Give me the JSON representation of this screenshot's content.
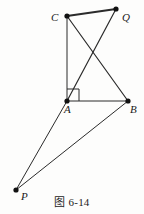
{
  "figure": {
    "caption": "图 6-14",
    "background_color": "#fdfdfc",
    "stroke_color": "#2b2b2b",
    "vertex_color": "#111111",
    "vertices": [
      {
        "id": "C",
        "label": "C",
        "x": 67,
        "y": 16,
        "label_x": 51,
        "label_y": 12
      },
      {
        "id": "Q",
        "label": "Q",
        "x": 116,
        "y": 9,
        "label_x": 122,
        "label_y": 12
      },
      {
        "id": "A",
        "label": "A",
        "x": 67,
        "y": 101,
        "label_x": 64,
        "label_y": 104
      },
      {
        "id": "B",
        "label": "B",
        "x": 128,
        "y": 101,
        "label_x": 130,
        "label_y": 104
      },
      {
        "id": "P",
        "label": "P",
        "x": 16,
        "y": 190,
        "label_x": 21,
        "label_y": 191
      }
    ],
    "segments": [
      {
        "name": "segment-CQ",
        "from": "C",
        "to": "Q",
        "width": 1.9
      },
      {
        "name": "segment-CA",
        "from": "C",
        "to": "A",
        "width": 1.0
      },
      {
        "name": "segment-CB",
        "from": "C",
        "to": "B",
        "width": 1.2
      },
      {
        "name": "segment-AQ",
        "from": "A",
        "to": "Q",
        "width": 1.2
      },
      {
        "name": "segment-AB",
        "from": "A",
        "to": "B",
        "width": 1.0
      },
      {
        "name": "segment-PA",
        "from": "P",
        "to": "A",
        "width": 1.0
      },
      {
        "name": "segment-PB",
        "from": "P",
        "to": "B",
        "width": 1.0
      }
    ],
    "right_angle_marker": {
      "name": "right-angle-marker-at-A",
      "at_vertex": "A",
      "size": 12
    }
  }
}
